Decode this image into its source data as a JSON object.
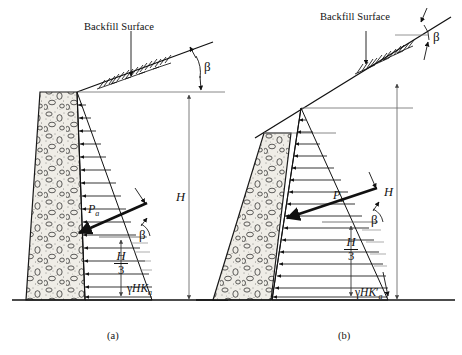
{
  "figure": {
    "title_visible": false,
    "colors": {
      "line": "#111111",
      "thin_line": "#666666",
      "fill_wall": "#e8e6e0",
      "background": "#ffffff"
    }
  },
  "panels": [
    {
      "id": "a",
      "caption": "(a)",
      "labels": {
        "backfill_surface": "Backfill Surface",
        "beta": "β",
        "height": "H",
        "resultant": "P",
        "resultant_sub": "a",
        "third_height_num": "H",
        "third_height_den": "3",
        "pressure_value_gamma": "γ",
        "pressure_value_H": "H",
        "pressure_value_K": "K",
        "pressure_value_K_sub": "a",
        "pressure_value_prime": ""
      }
    },
    {
      "id": "b",
      "caption": "(b)",
      "labels": {
        "backfill_surface": "Backfill Surface",
        "beta": "β",
        "height": "H",
        "resultant": "P",
        "resultant_sub": "a",
        "third_height_num": "H",
        "third_height_den": "3",
        "pressure_value_gamma": "γ",
        "pressure_value_H": "H",
        "pressure_value_K": "K",
        "pressure_value_K_sub": "a",
        "pressure_value_prime": "′"
      }
    }
  ]
}
